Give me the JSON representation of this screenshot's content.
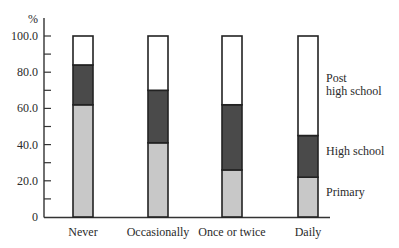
{
  "chart_data": {
    "type": "bar",
    "stacked": true,
    "title": "",
    "xlabel": "",
    "ylabel": "%",
    "ylim": [
      0,
      100
    ],
    "yticks": [
      "0",
      "20.0",
      "40.0",
      "60.0",
      "80.0",
      "100.0"
    ],
    "categories": [
      "Never",
      "Occasionally",
      "Once or twice",
      "Daily"
    ],
    "series": [
      {
        "name": "Primary",
        "color": "#c8c8c8",
        "values": [
          62,
          41,
          26,
          22
        ]
      },
      {
        "name": "High school",
        "color": "#4a4a4a",
        "values": [
          22,
          29,
          36,
          23
        ]
      },
      {
        "name": "Post high school",
        "color": "#ffffff",
        "values": [
          16,
          30,
          38,
          55
        ]
      }
    ],
    "legend": {
      "position": "right, inline labels beside last bar",
      "entries": [
        "Post high school",
        "High school",
        "Primary"
      ]
    },
    "grid": false
  }
}
